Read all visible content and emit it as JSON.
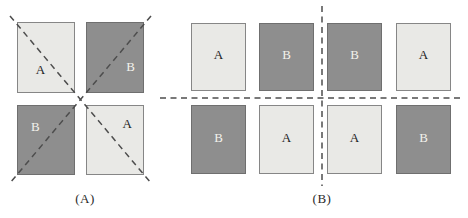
{
  "colors": {
    "light_square": "#e9e9e6",
    "dark_square": "#8e8e8e",
    "dashed_line": "#4d4d4d",
    "label_on_light": "#1c1c1c",
    "label_on_dark": "#f2f2ec"
  },
  "panel_a": {
    "caption": "(A)",
    "squares": [
      {
        "label": "A",
        "shade": "light",
        "row": 1,
        "col": 1
      },
      {
        "label": "B",
        "shade": "dark",
        "row": 1,
        "col": 2
      },
      {
        "label": "B",
        "shade": "dark",
        "row": 2,
        "col": 1
      },
      {
        "label": "A",
        "shade": "light",
        "row": 2,
        "col": 2
      }
    ],
    "lines": "two diagonal dashed lines crossing in an X"
  },
  "panel_b": {
    "caption": "(B)",
    "squares": [
      {
        "label": "A",
        "shade": "light",
        "row": 1,
        "col": 1
      },
      {
        "label": "B",
        "shade": "dark",
        "row": 1,
        "col": 2
      },
      {
        "label": "B",
        "shade": "dark",
        "row": 1,
        "col": 3
      },
      {
        "label": "A",
        "shade": "light",
        "row": 1,
        "col": 4
      },
      {
        "label": "B",
        "shade": "dark",
        "row": 2,
        "col": 1
      },
      {
        "label": "A",
        "shade": "light",
        "row": 2,
        "col": 2
      },
      {
        "label": "A",
        "shade": "light",
        "row": 2,
        "col": 3
      },
      {
        "label": "B",
        "shade": "dark",
        "row": 2,
        "col": 4
      }
    ],
    "lines": "horizontal and vertical dashed lines crossing in a plus"
  }
}
